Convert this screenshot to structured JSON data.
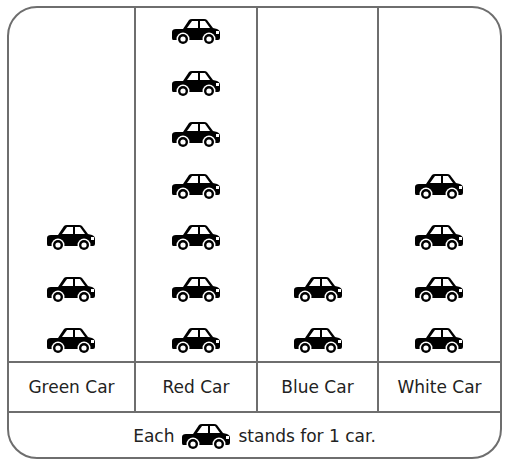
{
  "chart_data": {
    "type": "pictograph",
    "title": "",
    "categories": [
      "Green Car",
      "Red Car",
      "Blue Car",
      "White Car"
    ],
    "values": [
      3,
      7,
      2,
      4
    ],
    "icon": "car-icon",
    "key": "Each [car] stands for 1 car.",
    "unit_value": 1
  },
  "labels": [
    "Green Car",
    "Red Car",
    "Blue Car",
    "White Car"
  ],
  "key": {
    "prefix": "Each",
    "suffix": "stands for 1 car."
  }
}
